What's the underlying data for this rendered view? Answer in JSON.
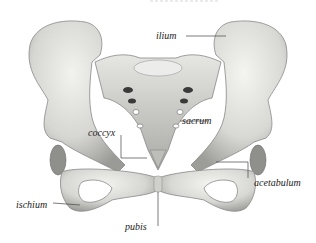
{
  "diagram": {
    "colors": {
      "bone": "#d9d9d6",
      "bone_shadow": "#8e8e8a",
      "foramen": "#3a3a3a",
      "leader_line": "#444444",
      "label": "#222222"
    },
    "labels": [
      {
        "id": "ilium",
        "text": "ilium"
      },
      {
        "id": "sacrum",
        "text": "sacrum"
      },
      {
        "id": "coccyx",
        "text": "coccyx"
      },
      {
        "id": "acetabulum",
        "text": "acetabulum"
      },
      {
        "id": "ischium",
        "text": "ischium"
      },
      {
        "id": "pubis",
        "text": "pubis"
      }
    ]
  }
}
